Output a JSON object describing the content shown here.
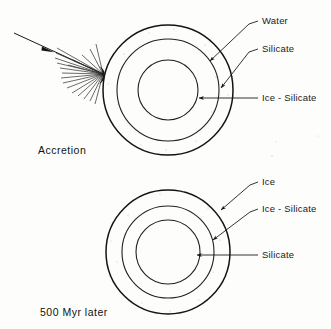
{
  "figure": {
    "background_color": "#fdfdfc",
    "ink_color": "#141414"
  },
  "panels": [
    {
      "id": "accretion",
      "caption": "Accretion",
      "caption_x": 38,
      "caption_y": 154,
      "center_x": 168,
      "center_y": 90,
      "layers": [
        {
          "name": "Water",
          "radius": 65,
          "fill": "white",
          "order": "outer"
        },
        {
          "name": "Silicate",
          "radius": 51,
          "fill": "hatch",
          "order": "middle"
        },
        {
          "name": "Ice - Silicate",
          "radius": 30,
          "fill": "stipple",
          "order": "inner"
        }
      ],
      "labels": [
        {
          "text": "Water",
          "text_x": 262,
          "text_y": 24,
          "leader": "M 258 21 L 249 24 L 208 63",
          "arrow_at": [
            208,
            63
          ],
          "arrow_angle": 137
        },
        {
          "text": "Silicate",
          "text_x": 262,
          "text_y": 52,
          "leader": "M 258 49 L 249 52 L 219 90",
          "arrow_at": [
            219,
            90
          ],
          "arrow_angle": 128
        },
        {
          "text": "Ice - Silicate",
          "text_x": 262,
          "text_y": 101,
          "leader": "M 258 98 L 196 98",
          "arrow_at": [
            196,
            98
          ],
          "arrow_angle": 180
        }
      ],
      "impact": {
        "arrow_path": "M 14 33 L 103 74",
        "arrowhead_at": [
          48,
          49
        ],
        "spray_origin_x": 103,
        "spray_origin_y": 74,
        "spray_count": 17
      }
    },
    {
      "id": "later",
      "caption": "500 Myr later",
      "caption_x": 40,
      "caption_y": 316,
      "center_x": 168,
      "center_y": 252,
      "layers": [
        {
          "name": "Ice",
          "radius": 62,
          "fill": "white",
          "order": "outer"
        },
        {
          "name": "Ice - Silicate",
          "radius": 46,
          "fill": "stipple",
          "order": "middle"
        },
        {
          "name": "Silicate",
          "radius": 32,
          "fill": "hatch",
          "order": "inner"
        }
      ],
      "labels": [
        {
          "text": "Ice",
          "text_x": 262,
          "text_y": 185,
          "leader": "M 258 182 L 250 185 L 219 212",
          "arrow_at": [
            219,
            212
          ],
          "arrow_angle": 139
        },
        {
          "text": "Ice - Silicate",
          "text_x": 262,
          "text_y": 212,
          "leader": "M 258 209 L 250 212 L 211 242",
          "arrow_at": [
            211,
            242
          ],
          "arrow_angle": 142
        },
        {
          "text": "Silicate",
          "text_x": 262,
          "text_y": 258,
          "leader": "M 258 255 L 194 255",
          "arrow_at": [
            194,
            255
          ],
          "arrow_angle": 180
        }
      ]
    }
  ]
}
